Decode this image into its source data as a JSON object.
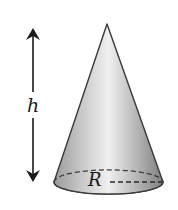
{
  "figure": {
    "labels": {
      "height": "h",
      "radius": "R"
    },
    "colors": {
      "outline": "#3a3a3a",
      "cone_light": "#f2f2f2",
      "cone_mid": "#bdbdbd",
      "cone_dark": "#8a8a8a",
      "arrow": "#1a1a1a"
    }
  }
}
